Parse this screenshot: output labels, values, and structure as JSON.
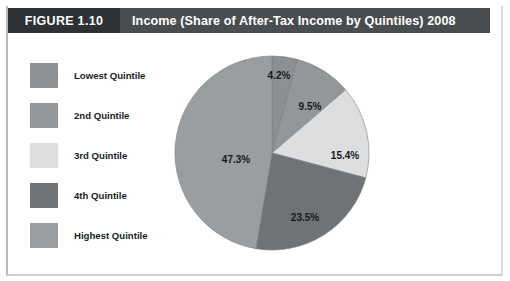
{
  "figure": {
    "tag": "FIGURE 1.10",
    "title": "Income (Share of After-Tax Income by Quintiles) 2008"
  },
  "legend": {
    "items": [
      {
        "label": "Lowest Quintile",
        "color": "#8d9093"
      },
      {
        "label": "2nd Quintile",
        "color": "#949799"
      },
      {
        "label": "3rd Quintile",
        "color": "#dcdedf"
      },
      {
        "label": "4th Quintile",
        "color": "#6f7376"
      },
      {
        "label": "Highest Quintile",
        "color": "#9b9ea0"
      }
    ]
  },
  "colors": {
    "header_band": "#4a4d4f",
    "figure_tag": "#2e3133",
    "text_on_dark": "#ffffff",
    "label_text": "#17191b",
    "background": "#ffffff"
  },
  "chart_data": {
    "type": "pie",
    "title": "Income (Share of After-Tax Income by Quintiles) 2008",
    "categories": [
      "Lowest Quintile",
      "2nd Quintile",
      "3rd Quintile",
      "4th Quintile",
      "Highest Quintile"
    ],
    "values": [
      4.2,
      9.5,
      15.4,
      23.5,
      47.3
    ],
    "value_labels": [
      "4.2%",
      "9.5%",
      "15.4%",
      "23.5%",
      "47.3%"
    ],
    "colors": [
      "#8d9093",
      "#949799",
      "#dcdedf",
      "#6f7376",
      "#9b9ea0"
    ],
    "unit": "percent",
    "start_angle_deg": 0,
    "direction": "clockwise",
    "legend_position": "left",
    "grid": false,
    "label_positions": [
      {
        "label": "4.2%",
        "x": 105,
        "y": 20
      },
      {
        "label": "9.5%",
        "x": 136,
        "y": 51
      },
      {
        "label": "15.4%",
        "x": 171,
        "y": 100
      },
      {
        "label": "23.5%",
        "x": 131,
        "y": 162
      },
      {
        "label": "47.3%",
        "x": 62,
        "y": 104
      }
    ]
  }
}
